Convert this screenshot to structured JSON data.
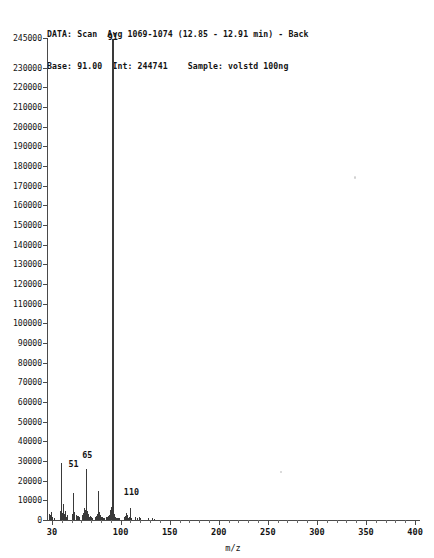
{
  "header": {
    "line1": "DATA: Scan  Avg 1069-1074 (12.85 - 12.91 min) - Back",
    "line2": "Base: 91.00  Int: 244741    Sample: volstd 100ng",
    "data_label": "DATA:",
    "scan_mode": "Scan",
    "scan_range": "Avg 1069-1074",
    "time_range": "(12.85 - 12.91 min)",
    "background": "- Back",
    "base_label": "Base:",
    "base_value": "91.00",
    "int_label": "Int:",
    "int_value": "244741",
    "sample_label": "Sample:",
    "sample_value": "volstd 100ng"
  },
  "chart_data": {
    "type": "bar",
    "title": "",
    "xlabel": "m/z",
    "ylabel": "",
    "xlim": [
      25,
      405
    ],
    "ylim": [
      0,
      245000
    ],
    "grid": false,
    "legend": null,
    "y_ticks": [
      0,
      10000,
      20000,
      30000,
      40000,
      50000,
      60000,
      70000,
      80000,
      90000,
      100000,
      110000,
      120000,
      130000,
      140000,
      150000,
      160000,
      170000,
      180000,
      190000,
      200000,
      210000,
      220000,
      230000,
      245000
    ],
    "y_tick_labels": [
      "0",
      "10000",
      "20000",
      "30000",
      "40000",
      "50000",
      "60000",
      "70000",
      "80000",
      "90000",
      "100000",
      "110000",
      "120000",
      "130000",
      "140000",
      "150000",
      "160000",
      "170000",
      "180000",
      "190000",
      "200000",
      "210000",
      "220000",
      "230000",
      "245000"
    ],
    "x_ticks": [
      30,
      100,
      150,
      200,
      250,
      300,
      350,
      400
    ],
    "x_tick_labels": [
      "30",
      "100",
      "150",
      "200",
      "250",
      "300",
      "350",
      "400"
    ],
    "x_minor_ticks": [
      40,
      50,
      60,
      70,
      80,
      90,
      110,
      120,
      130,
      140,
      160,
      170,
      180,
      190,
      210,
      220,
      230,
      240,
      260,
      270,
      280,
      290,
      310,
      320,
      330,
      340,
      360,
      370,
      380,
      390
    ],
    "base_peak_mz": 91,
    "base_peak_intensity": 244741,
    "annotations": [
      {
        "mz": 51,
        "label": "51",
        "label_y": 26000
      },
      {
        "mz": 65,
        "label": "65",
        "label_y": 30500
      },
      {
        "mz": 91,
        "label": "91",
        "label_y": 243000
      },
      {
        "mz": 110,
        "label": "110",
        "label_y": 11500
      }
    ],
    "mz": [
      27,
      28,
      29,
      30,
      32,
      38,
      39,
      40,
      41,
      42,
      43,
      44,
      45,
      50,
      51,
      52,
      53,
      55,
      56,
      57,
      58,
      61,
      62,
      63,
      64,
      65,
      66,
      67,
      68,
      69,
      70,
      71,
      74,
      75,
      76,
      77,
      78,
      79,
      80,
      81,
      82,
      83,
      85,
      86,
      87,
      88,
      89,
      90,
      91,
      92,
      93,
      94,
      95,
      96,
      97,
      98,
      103,
      104,
      105,
      106,
      107,
      108,
      109,
      110,
      111,
      115,
      117,
      119,
      120,
      128,
      132,
      134
    ],
    "intensity": [
      3200,
      2600,
      4100,
      1500,
      1100,
      4500,
      29000,
      3600,
      8200,
      3000,
      4800,
      1600,
      2300,
      3300,
      13500,
      4200,
      3000,
      2400,
      1800,
      2200,
      1400,
      2600,
      3600,
      5900,
      5200,
      26000,
      4400,
      3200,
      1500,
      2000,
      1300,
      1200,
      1400,
      2100,
      3100,
      14500,
      4100,
      2800,
      1600,
      1300,
      1100,
      1000,
      1300,
      1500,
      2000,
      2400,
      5200,
      6600,
      244741,
      19200,
      3000,
      1500,
      1200,
      1000,
      900,
      900,
      1400,
      2100,
      3600,
      2700,
      1600,
      1100,
      1300,
      6100,
      1200,
      1500,
      1100,
      1400,
      1100,
      900,
      800,
      700
    ]
  }
}
